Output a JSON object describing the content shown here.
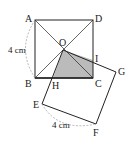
{
  "figure": {
    "points": {
      "A": {
        "label": "A",
        "x": 35,
        "y": 20
      },
      "D": {
        "label": "D",
        "x": 93,
        "y": 20
      },
      "B": {
        "label": "B",
        "x": 35,
        "y": 78
      },
      "C": {
        "label": "C",
        "x": 93,
        "y": 78
      },
      "O": {
        "label": "O",
        "x": 63,
        "y": 50
      },
      "I": {
        "label": "I",
        "x": 93,
        "y": 60
      },
      "H": {
        "label": "H",
        "x": 53,
        "y": 78
      },
      "G": {
        "label": "G",
        "x": 116,
        "y": 72
      },
      "E": {
        "label": "E",
        "x": 42,
        "y": 104
      },
      "F": {
        "label": "F",
        "x": 96,
        "y": 124
      }
    },
    "dimensions": {
      "side_ab": "4 cm",
      "side_ef": "4 cm"
    },
    "colors": {
      "stroke": "#222222",
      "shade": "#bbbbbb",
      "dashed": "#999999"
    }
  }
}
